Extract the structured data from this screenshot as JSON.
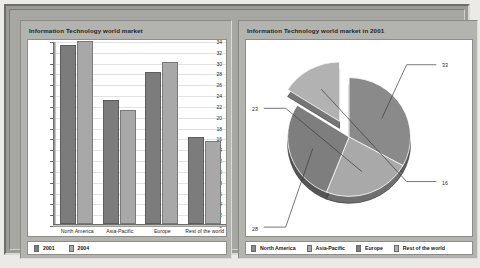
{
  "panels": {
    "left": {
      "title": "Information Technology world market"
    },
    "right": {
      "title": "Information Technology world market in 2001"
    }
  },
  "colors": {
    "series_2001": "#7c7c7c",
    "series_2004": "#a8a8a8",
    "pie_north_america": "#8a8a8a",
    "pie_asia_pacific": "#a9a9a9",
    "pie_europe": "#7e7e7e",
    "pie_rest_of_world": "#b2b2b2",
    "panel_background": "#b3b3af",
    "plot_background": "#ffffff"
  },
  "chart_data": [
    {
      "type": "bar",
      "title": "Information Technology world market",
      "xlabel": "",
      "ylabel": "",
      "ylim": [
        0,
        34
      ],
      "yticks": [
        0,
        2,
        4,
        6,
        8,
        10,
        12,
        14,
        16,
        18,
        20,
        22,
        24,
        26,
        28,
        30,
        32,
        34
      ],
      "grid": true,
      "legend_position": "bottom-left",
      "categories": [
        "North America",
        "Asia-Pacific",
        "Europe",
        "Rest of the world"
      ],
      "series": [
        {
          "name": "2001",
          "values": [
            33,
            23,
            28,
            16
          ]
        },
        {
          "name": "2004",
          "values": [
            33.8,
            21,
            30,
            15.4
          ]
        }
      ]
    },
    {
      "type": "pie",
      "title": "Information Technology world market in 2001",
      "legend_position": "bottom",
      "exploded_slice": "Rest of the world",
      "labels": [
        "North America",
        "Asia-Pacific",
        "Europe",
        "Rest of the world"
      ],
      "values": [
        33,
        23,
        28,
        16
      ],
      "data_labels": [
        "33",
        "23",
        "28",
        "16"
      ]
    }
  ]
}
